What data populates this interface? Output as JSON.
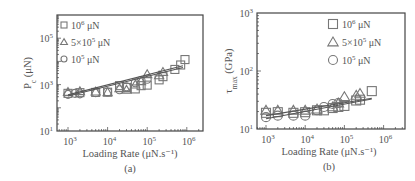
{
  "chart_data": [
    {
      "id": "a",
      "type": "scatter",
      "caption": "(a)",
      "xlabel": "Loading Rate (μN.s⁻¹)",
      "ylabel": "P_c (μN)",
      "ylabel_main": "P",
      "ylabel_sub": "c",
      "ylabel_unit": " (μN)",
      "xscale": "log",
      "yscale": "log",
      "xlim": [
        600,
        1500000
      ],
      "ylim": [
        10,
        500000
      ],
      "xticks": [
        {
          "exp": "3",
          "value": 1000
        },
        {
          "exp": "4",
          "value": 10000
        },
        {
          "exp": "5",
          "value": 100000
        },
        {
          "exp": "6",
          "value": 1000000
        }
      ],
      "yticks": [
        {
          "exp": "1",
          "value": 10
        },
        {
          "exp": "3",
          "value": 1000
        },
        {
          "exp": "5",
          "value": 100000
        }
      ],
      "grid": false,
      "legend_position": "upper left",
      "series": [
        {
          "name": "10⁶ μN",
          "legend_base": "10",
          "legend_exp": "6",
          "legend_unit": " μN",
          "marker": "square",
          "points": [
            [
              1000,
              420
            ],
            [
              2000,
              450
            ],
            [
              5000,
              460
            ],
            [
              10000,
              470
            ],
            [
              20000,
              900
            ],
            [
              30000,
              750
            ],
            [
              50000,
              650
            ],
            [
              70000,
              900
            ],
            [
              100000,
              950
            ],
            [
              200000,
              1600
            ],
            [
              250000,
              2200
            ],
            [
              500000,
              4500
            ],
            [
              700000,
              7000
            ],
            [
              900000,
              12000
            ]
          ]
        },
        {
          "name": "5×10⁵ μN",
          "legend_base": "5×10",
          "legend_exp": "5",
          "legend_unit": " μN",
          "marker": "triangle",
          "points": [
            [
              1000,
              480
            ],
            [
              2000,
              520
            ],
            [
              5000,
              500
            ],
            [
              10000,
              470
            ],
            [
              20000,
              700
            ],
            [
              30000,
              600
            ],
            [
              50000,
              1000
            ],
            [
              70000,
              1400
            ],
            [
              100000,
              2800
            ],
            [
              200000,
              2500
            ],
            [
              250000,
              3500
            ]
          ]
        },
        {
          "name": "10⁵ μN",
          "legend_base": "10",
          "legend_exp": "5",
          "legend_unit": " μN",
          "marker": "circle",
          "points": [
            [
              1000,
              380
            ],
            [
              1500,
              420
            ],
            [
              2000,
              400
            ],
            [
              5000,
              450
            ],
            [
              10000,
              480
            ],
            [
              20000,
              600
            ],
            [
              30000,
              800
            ],
            [
              50000,
              1200
            ],
            [
              70000,
              1500
            ],
            [
              100000,
              1700
            ]
          ]
        }
      ],
      "fit_lines": [
        {
          "from": [
            1000,
            320
          ],
          "to": [
            800000,
            5500
          ]
        },
        {
          "from": [
            1000,
            360
          ],
          "to": [
            800000,
            6500
          ]
        }
      ]
    },
    {
      "id": "b",
      "type": "scatter",
      "caption": "(b)",
      "xlabel": "Loading Rate (μN.s⁻¹)",
      "ylabel": "τ_max (GPa)",
      "ylabel_main": "τ",
      "ylabel_sub": "max",
      "ylabel_unit": " (GPa)",
      "xscale": "log",
      "yscale": "log",
      "xlim": [
        600,
        1500000
      ],
      "ylim": [
        10,
        1000
      ],
      "xticks": [
        {
          "exp": "3",
          "value": 1000
        },
        {
          "exp": "4",
          "value": 10000
        },
        {
          "exp": "5",
          "value": 100000
        },
        {
          "exp": "6",
          "value": 1000000
        }
      ],
      "yticks": [
        {
          "exp": "1",
          "value": 10
        },
        {
          "exp": "2",
          "value": 100
        },
        {
          "exp": "3",
          "value": 1000
        }
      ],
      "grid": false,
      "legend_position": "upper right",
      "series": [
        {
          "name": "10⁶ μN",
          "legend_base": "10",
          "legend_exp": "6",
          "legend_unit": " μN",
          "marker": "square",
          "points": [
            [
              1000,
              19
            ],
            [
              2000,
              19.5
            ],
            [
              5000,
              19
            ],
            [
              10000,
              19.5
            ],
            [
              20000,
              21
            ],
            [
              30000,
              21
            ],
            [
              50000,
              23
            ],
            [
              70000,
              24
            ],
            [
              100000,
              25
            ],
            [
              200000,
              31
            ],
            [
              250000,
              32
            ],
            [
              500000,
              45
            ]
          ]
        },
        {
          "name": "5×10⁵ μN",
          "legend_base": "5×10",
          "legend_exp": "5",
          "legend_unit": " μN",
          "marker": "triangle",
          "points": [
            [
              1000,
              21
            ],
            [
              2000,
              21
            ],
            [
              5000,
              21
            ],
            [
              10000,
              21
            ],
            [
              20000,
              22
            ],
            [
              50000,
              24
            ],
            [
              70000,
              28
            ],
            [
              100000,
              36
            ],
            [
              200000,
              38
            ],
            [
              250000,
              41
            ]
          ]
        },
        {
          "name": "10⁵ μN",
          "legend_base": "10",
          "legend_exp": "5",
          "legend_unit": " μN",
          "marker": "circle",
          "points": [
            [
              1000,
              16
            ],
            [
              2000,
              17
            ],
            [
              5000,
              17
            ],
            [
              10000,
              17
            ],
            [
              20000,
              21
            ],
            [
              30000,
              24
            ],
            [
              50000,
              27
            ],
            [
              70000,
              28
            ]
          ]
        }
      ],
      "fit_lines": [
        {
          "from": [
            1000,
            17
          ],
          "to": [
            500000,
            34
          ]
        },
        {
          "from": [
            1000,
            15
          ],
          "to": [
            500000,
            33
          ]
        }
      ]
    }
  ]
}
